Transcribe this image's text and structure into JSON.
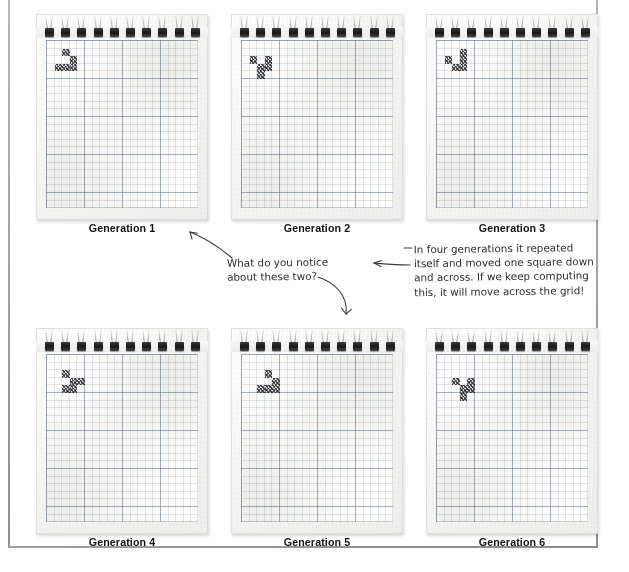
{
  "diagram": {
    "grid_cols": 20,
    "grid_rows": 22
  },
  "pads": [
    {
      "caption": "Generation 1",
      "cells": [
        [
          2,
          1
        ],
        [
          3,
          2
        ],
        [
          1,
          3
        ],
        [
          2,
          3
        ],
        [
          3,
          3
        ]
      ]
    },
    {
      "caption": "Generation 2",
      "cells": [
        [
          1,
          2
        ],
        [
          3,
          2
        ],
        [
          2,
          3
        ],
        [
          3,
          3
        ],
        [
          2,
          4
        ]
      ]
    },
    {
      "caption": "Generation 3",
      "cells": [
        [
          3,
          1
        ],
        [
          1,
          2
        ],
        [
          3,
          2
        ],
        [
          2,
          3
        ],
        [
          3,
          3
        ]
      ]
    },
    {
      "caption": "Generation 4",
      "cells": [
        [
          2,
          2
        ],
        [
          3,
          3
        ],
        [
          4,
          3
        ],
        [
          2,
          4
        ],
        [
          3,
          4
        ]
      ]
    },
    {
      "caption": "Generation 5",
      "cells": [
        [
          3,
          2
        ],
        [
          4,
          3
        ],
        [
          2,
          4
        ],
        [
          3,
          4
        ],
        [
          4,
          4
        ]
      ]
    },
    {
      "caption": "Generation 6",
      "cells": [
        [
          2,
          3
        ],
        [
          4,
          3
        ],
        [
          3,
          4
        ],
        [
          4,
          4
        ],
        [
          3,
          5
        ]
      ]
    }
  ],
  "annotations": {
    "left_note": "What do you notice\nabout these two?",
    "right_note": "In four generations it repeated\nitself and moved one square down\nand across. If we keep computing\nthis, it will move across the grid!"
  },
  "colors": {
    "ink": "#2c2c2c",
    "caption": "#131313",
    "grid_line": "#5f738c",
    "ring": "#161616",
    "page_rule": "#9a9a9a"
  }
}
